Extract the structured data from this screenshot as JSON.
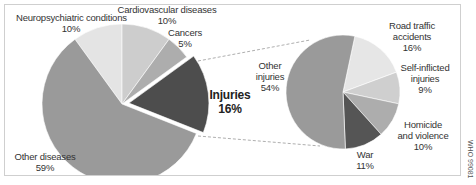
{
  "chart_data": [
    {
      "type": "pie",
      "title": "",
      "labels": [
        "Other diseases",
        "Neuropsychiatric conditions",
        "Cardiovascular diseases",
        "Cancers",
        "Injuries"
      ],
      "values": [
        59,
        10,
        10,
        5,
        16
      ],
      "units": "%",
      "exploded": "Injuries",
      "colors": [
        "#9a9a9a",
        "#e4e4e4",
        "#cdcdcd",
        "#adadad",
        "#4d4d4d"
      ]
    },
    {
      "type": "pie",
      "title": "Injuries breakdown",
      "labels": [
        "Road traffic accidents",
        "Self-inflicted injuries",
        "Homicide and violence",
        "War",
        "Other injuries"
      ],
      "values": [
        16,
        9,
        10,
        11,
        54
      ],
      "units": "%",
      "colors": [
        "#e6e6e6",
        "#cfcfcf",
        "#adadad",
        "#555555",
        "#9a9a9a"
      ]
    }
  ],
  "labels": {
    "neuro": {
      "name": "Neuropsychiatric conditions",
      "pct": "10%"
    },
    "cardio": {
      "name": "Cardiovascular diseases",
      "pct": "10%"
    },
    "cancers": {
      "name": "Cancers",
      "pct": "5%"
    },
    "injuries": {
      "name": "Injuries",
      "pct": "16%"
    },
    "other_diseases": {
      "name": "Other diseases",
      "pct": "59%"
    },
    "road": {
      "line1": "Road traffic",
      "line2": "accidents",
      "pct": "16%"
    },
    "self": {
      "line1": "Self-inflicted",
      "line2": "injuries",
      "pct": "9%"
    },
    "homicide": {
      "line1": "Homicide",
      "line2": "and violence",
      "pct": "10%"
    },
    "war": {
      "name": "War",
      "pct": "11%"
    },
    "other_inj": {
      "line1": "Other",
      "line2": "injuries",
      "pct": "54%"
    }
  },
  "figure_code": "WHO 99081"
}
